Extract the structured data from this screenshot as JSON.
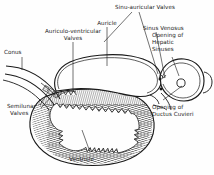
{
  "figure": {
    "style": "pen-and-ink line drawing, hatched ventricle wall",
    "colors": {
      "background": "#fefefe",
      "ink": "#1a1a1a",
      "hatch": "#4a4a4a"
    }
  },
  "labels": {
    "sinu_auricular_valves": "Sinu-auricular Valves",
    "auricle": "Auricle",
    "auriculo_ventricular_valves_1": "Auriculo-ventricular",
    "auriculo_ventricular_valves_2": "Valves",
    "conus": "Conus",
    "semilunar_valves_1": "Semilunar",
    "semilunar_valves_2": "Valves",
    "sinus_venosus": "Sinus Venosus",
    "opening_hepatic_1": "Opening of",
    "opening_hepatic_2": "Hepatic",
    "opening_hepatic_3": "Sinuses",
    "opening_ductus_1": "Opening of",
    "opening_ductus_2": "Ductus Cuvieri",
    "ventricle": "Ventricle"
  },
  "structures": [
    {
      "name": "conus",
      "kind": "vessel-tube"
    },
    {
      "name": "semilunar-valves",
      "kind": "valve-cluster"
    },
    {
      "name": "auriculo-ventricular-valves",
      "kind": "valve-cluster"
    },
    {
      "name": "auricle",
      "kind": "chamber"
    },
    {
      "name": "ventricle",
      "kind": "chamber-hatched-wall"
    },
    {
      "name": "sinus-venosus",
      "kind": "chamber-pouch"
    },
    {
      "name": "sinu-auricular-valves",
      "kind": "valve-cluster"
    },
    {
      "name": "opening-of-ductus-cuvieri",
      "kind": "aperture-circle"
    },
    {
      "name": "opening-of-hepatic-sinuses",
      "kind": "aperture"
    }
  ]
}
